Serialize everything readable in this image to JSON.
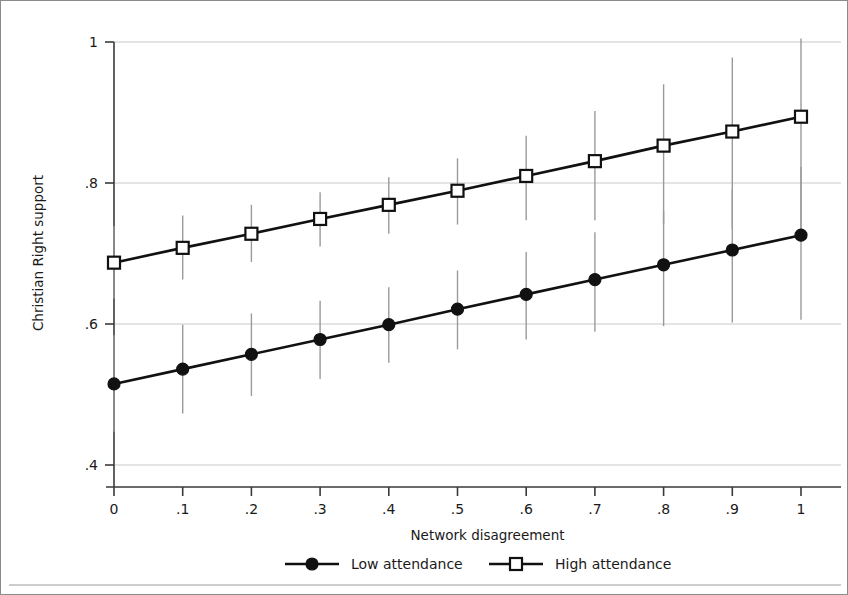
{
  "chart_data": {
    "type": "line",
    "title": "",
    "xlabel": "Network disagreement",
    "ylabel": "Christian Right support",
    "x": [
      0,
      0.1,
      0.2,
      0.3,
      0.4,
      0.5,
      0.6,
      0.7,
      0.8,
      0.9,
      1
    ],
    "xticklabels": [
      "0",
      ".1",
      ".2",
      ".3",
      ".4",
      ".5",
      ".6",
      ".7",
      ".8",
      ".9",
      "1"
    ],
    "yticklabels": [
      ".4",
      ".6",
      ".8",
      "1"
    ],
    "yticks": [
      0.4,
      0.6,
      0.8,
      1.0
    ],
    "xlim": [
      0,
      1
    ],
    "ylim": [
      0.345,
      1.0
    ],
    "grid": "horizontal",
    "legend_position": "bottom",
    "series": [
      {
        "name": "Low attendance",
        "marker": "filled-circle",
        "color": "#111111",
        "values": [
          0.515,
          0.536,
          0.557,
          0.578,
          0.599,
          0.621,
          0.642,
          0.663,
          0.684,
          0.705,
          0.726
        ],
        "ci_lower": [
          0.447,
          0.473,
          0.498,
          0.522,
          0.545,
          0.564,
          0.578,
          0.589,
          0.597,
          0.602,
          0.606
        ],
        "ci_upper": [
          0.584,
          0.599,
          0.615,
          0.633,
          0.652,
          0.676,
          0.702,
          0.73,
          0.76,
          0.791,
          0.823
        ]
      },
      {
        "name": "High attendance",
        "marker": "open-square",
        "color": "#111111",
        "values": [
          0.687,
          0.708,
          0.728,
          0.749,
          0.769,
          0.789,
          0.81,
          0.831,
          0.853,
          0.873,
          0.894
        ],
        "ci_lower": [
          0.636,
          0.663,
          0.688,
          0.71,
          0.728,
          0.741,
          0.747,
          0.747,
          0.742,
          0.735,
          0.727
        ],
        "ci_upper": [
          0.739,
          0.754,
          0.769,
          0.787,
          0.808,
          0.835,
          0.867,
          0.902,
          0.94,
          0.978,
          1.016
        ]
      }
    ]
  },
  "axes": {
    "y_title": "Christian Right support",
    "x_title": "Network disagreement"
  },
  "legend": {
    "entries": [
      {
        "label": "Low attendance",
        "marker": "filled-circle"
      },
      {
        "label": "High attendance",
        "marker": "open-square"
      }
    ]
  }
}
